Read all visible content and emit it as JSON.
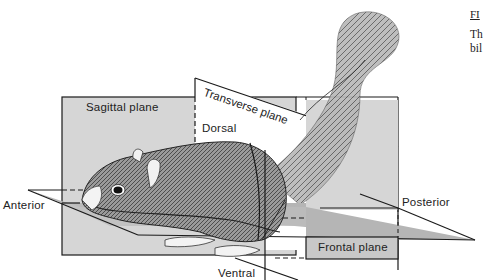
{
  "figure": {
    "labels": {
      "sagittal_plane": "Sagittal plane",
      "transverse_plane": "Transverse plane",
      "frontal_plane": "Frontal plane",
      "dorsal": "Dorsal",
      "ventral": "Ventral",
      "anterior": "Anterior",
      "posterior": "Posterior"
    },
    "colors": {
      "plane_fill": "#d4d4d4",
      "plane_dark": "#a8a8a8",
      "line": "#1a1a1a",
      "background": "#ffffff"
    }
  },
  "caption": {
    "heading": "FI",
    "line1": "Th",
    "line2": "bil"
  }
}
